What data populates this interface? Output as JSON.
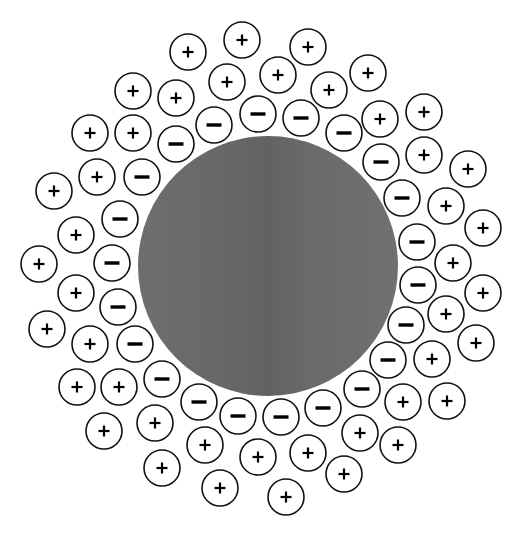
{
  "diagram": {
    "width": 524,
    "height": 534,
    "background": "#ffffff",
    "sphere": {
      "label": "charged particle",
      "cx": 268,
      "cy": 266,
      "r": 130,
      "fill": "#6b6b6b",
      "fill_highlight": "#747474",
      "fill_shadow": "#626262"
    },
    "ion_style": {
      "r": 18,
      "stroke": "#111111",
      "stroke_width": 1.6,
      "fill": "#ffffff",
      "sign_color": "#000000"
    },
    "counts": {
      "positive": 44,
      "negative": 22
    },
    "negative_ions": [
      {
        "sign": "−",
        "x": 214,
        "y": 125
      },
      {
        "sign": "−",
        "x": 258,
        "y": 114
      },
      {
        "sign": "−",
        "x": 301,
        "y": 118
      },
      {
        "sign": "−",
        "x": 344,
        "y": 133
      },
      {
        "sign": "−",
        "x": 176,
        "y": 144
      },
      {
        "sign": "−",
        "x": 381,
        "y": 162
      },
      {
        "sign": "−",
        "x": 142,
        "y": 177
      },
      {
        "sign": "−",
        "x": 402,
        "y": 198
      },
      {
        "sign": "−",
        "x": 120,
        "y": 219
      },
      {
        "sign": "−",
        "x": 417,
        "y": 242
      },
      {
        "sign": "−",
        "x": 112,
        "y": 263
      },
      {
        "sign": "−",
        "x": 418,
        "y": 285
      },
      {
        "sign": "−",
        "x": 118,
        "y": 307
      },
      {
        "sign": "−",
        "x": 406,
        "y": 325
      },
      {
        "sign": "−",
        "x": 135,
        "y": 344
      },
      {
        "sign": "−",
        "x": 388,
        "y": 360
      },
      {
        "sign": "−",
        "x": 162,
        "y": 379
      },
      {
        "sign": "−",
        "x": 362,
        "y": 389
      },
      {
        "sign": "−",
        "x": 199,
        "y": 402
      },
      {
        "sign": "−",
        "x": 323,
        "y": 408
      },
      {
        "sign": "−",
        "x": 238,
        "y": 416
      },
      {
        "sign": "−",
        "x": 281,
        "y": 417
      }
    ],
    "positive_ions": [
      {
        "sign": "+",
        "x": 242,
        "y": 40
      },
      {
        "sign": "+",
        "x": 308,
        "y": 47
      },
      {
        "sign": "+",
        "x": 188,
        "y": 52
      },
      {
        "sign": "+",
        "x": 227,
        "y": 82
      },
      {
        "sign": "+",
        "x": 278,
        "y": 75
      },
      {
        "sign": "+",
        "x": 368,
        "y": 73
      },
      {
        "sign": "+",
        "x": 133,
        "y": 91
      },
      {
        "sign": "+",
        "x": 176,
        "y": 98
      },
      {
        "sign": "+",
        "x": 329,
        "y": 90
      },
      {
        "sign": "+",
        "x": 380,
        "y": 119
      },
      {
        "sign": "+",
        "x": 424,
        "y": 112
      },
      {
        "sign": "+",
        "x": 90,
        "y": 133
      },
      {
        "sign": "+",
        "x": 133,
        "y": 133
      },
      {
        "sign": "+",
        "x": 424,
        "y": 155
      },
      {
        "sign": "+",
        "x": 468,
        "y": 169
      },
      {
        "sign": "+",
        "x": 97,
        "y": 177
      },
      {
        "sign": "+",
        "x": 54,
        "y": 191
      },
      {
        "sign": "+",
        "x": 446,
        "y": 206
      },
      {
        "sign": "+",
        "x": 483,
        "y": 228
      },
      {
        "sign": "+",
        "x": 76,
        "y": 235
      },
      {
        "sign": "+",
        "x": 453,
        "y": 263
      },
      {
        "sign": "+",
        "x": 39,
        "y": 264
      },
      {
        "sign": "+",
        "x": 76,
        "y": 293
      },
      {
        "sign": "+",
        "x": 483,
        "y": 293
      },
      {
        "sign": "+",
        "x": 446,
        "y": 314
      },
      {
        "sign": "+",
        "x": 47,
        "y": 329
      },
      {
        "sign": "+",
        "x": 90,
        "y": 344
      },
      {
        "sign": "+",
        "x": 476,
        "y": 343
      },
      {
        "sign": "+",
        "x": 432,
        "y": 359
      },
      {
        "sign": "+",
        "x": 77,
        "y": 387
      },
      {
        "sign": "+",
        "x": 119,
        "y": 387
      },
      {
        "sign": "+",
        "x": 403,
        "y": 402
      },
      {
        "sign": "+",
        "x": 447,
        "y": 401
      },
      {
        "sign": "+",
        "x": 104,
        "y": 431
      },
      {
        "sign": "+",
        "x": 155,
        "y": 423
      },
      {
        "sign": "+",
        "x": 360,
        "y": 433
      },
      {
        "sign": "+",
        "x": 398,
        "y": 445
      },
      {
        "sign": "+",
        "x": 205,
        "y": 445
      },
      {
        "sign": "+",
        "x": 258,
        "y": 457
      },
      {
        "sign": "+",
        "x": 308,
        "y": 453
      },
      {
        "sign": "+",
        "x": 162,
        "y": 468
      },
      {
        "sign": "+",
        "x": 344,
        "y": 474
      },
      {
        "sign": "+",
        "x": 220,
        "y": 488
      },
      {
        "sign": "+",
        "x": 286,
        "y": 497
      }
    ]
  }
}
